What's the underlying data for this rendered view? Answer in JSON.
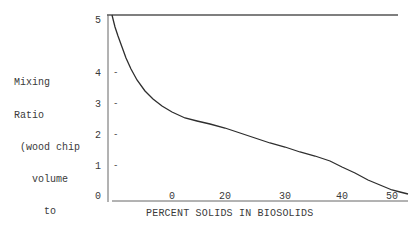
{
  "chart_data": {
    "type": "line",
    "title": "",
    "xlabel": "PERCENT SOLIDS IN BIOSOLIDS",
    "ylabel_lines": [
      "Mixing",
      "Ratio",
      " (wood chip",
      "   volume",
      "     to",
      "  biosolids",
      "   volume)"
    ],
    "ylabel": "Mixing Ratio (wood chip volume to biosolids volume)",
    "x_tick_labels": [
      "0",
      "20",
      "30",
      "40",
      "50"
    ],
    "y_tick_labels": [
      "0",
      "1",
      "2",
      "3",
      "4",
      "5"
    ],
    "ylim": [
      0,
      5
    ],
    "xlim": [
      0,
      52
    ],
    "grid": false,
    "legend": null,
    "series": [
      {
        "name": "Mixing ratio",
        "x": [
          -10,
          -5,
          0,
          10,
          20,
          30,
          40,
          50,
          52
        ],
        "values": [
          5.0,
          3.8,
          2.7,
          2.5,
          2.3,
          1.6,
          1.0,
          0.3,
          0.15
        ]
      }
    ],
    "curve_px": [
      [
        112,
        15
      ],
      [
        115,
        27
      ],
      [
        118,
        36
      ],
      [
        122,
        47
      ],
      [
        126,
        58
      ],
      [
        131,
        69
      ],
      [
        137,
        80
      ],
      [
        145,
        91
      ],
      [
        153,
        99
      ],
      [
        162,
        106
      ],
      [
        172,
        112
      ],
      [
        185,
        118
      ],
      [
        197,
        121
      ],
      [
        210,
        124
      ],
      [
        225,
        128
      ],
      [
        240,
        133
      ],
      [
        255,
        138
      ],
      [
        270,
        143
      ],
      [
        285,
        147
      ],
      [
        300,
        152
      ],
      [
        315,
        156
      ],
      [
        330,
        161
      ],
      [
        342,
        167
      ],
      [
        355,
        173
      ],
      [
        368,
        180
      ],
      [
        380,
        185
      ],
      [
        392,
        190
      ],
      [
        400,
        192
      ],
      [
        408,
        194
      ]
    ],
    "colors": {
      "axis": "#555555",
      "curve": "#2e2e2e",
      "text": "#3a3a3a"
    }
  },
  "axes": {
    "y_tick_positions": [
      {
        "label": "5",
        "top": 15
      },
      {
        "label": "4",
        "top": 68
      },
      {
        "label": "3",
        "top": 99
      },
      {
        "label": "2",
        "top": 130
      },
      {
        "label": "1",
        "top": 161
      },
      {
        "label": "0",
        "top": 191
      }
    ],
    "y_marks": [
      "-",
      "-",
      "-",
      "-"
    ],
    "x_tick_positions": [
      {
        "label": "0",
        "left": 172
      },
      {
        "label": "20",
        "left": 225
      },
      {
        "label": "30",
        "left": 285
      },
      {
        "label": "40",
        "left": 342
      },
      {
        "label": "50",
        "left": 392
      }
    ]
  }
}
